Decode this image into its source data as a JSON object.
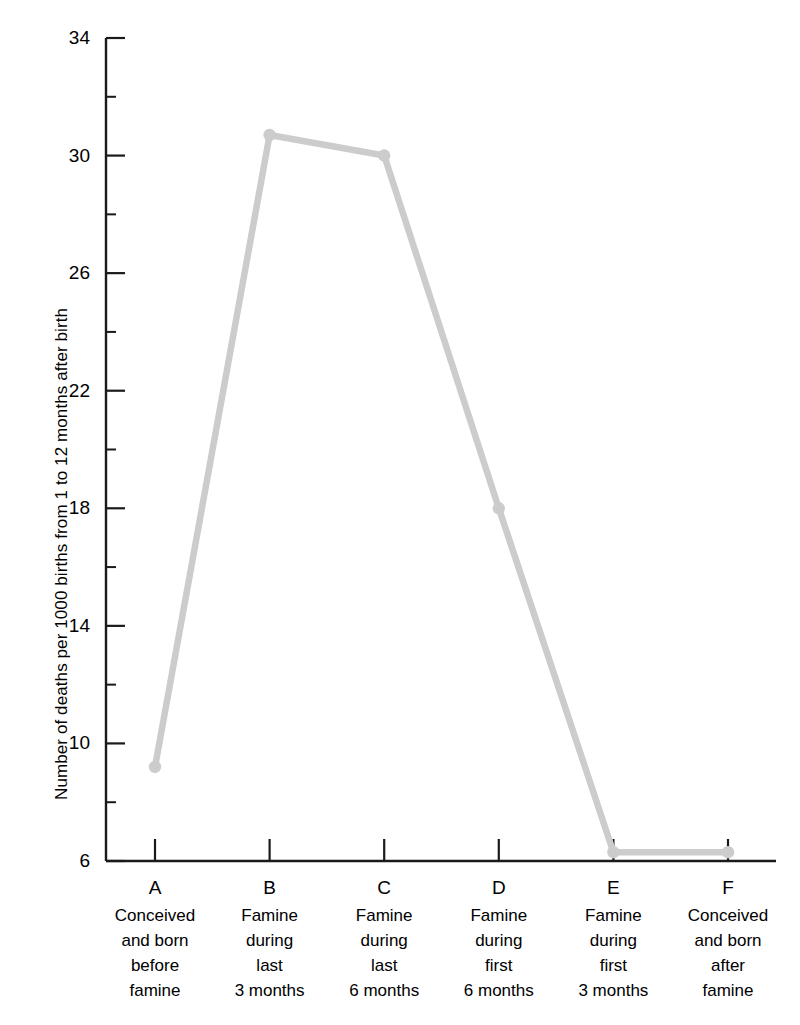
{
  "chart_data": {
    "type": "line",
    "title": "",
    "xlabel": "",
    "ylabel": "Number of deaths per 1000 births from 1 to 12 months after birth",
    "ylim": [
      6,
      34
    ],
    "ytick_labels": [
      "34",
      "30",
      "26",
      "22",
      "18",
      "14",
      "10",
      "6"
    ],
    "ytick_values": [
      34,
      30,
      26,
      22,
      18,
      14,
      10,
      6
    ],
    "yminor_values": [
      32,
      28,
      24,
      20,
      16,
      12,
      8
    ],
    "grid": false,
    "legend": "none",
    "line_color": "#cccccc",
    "axis_color": "#1a1a1a",
    "categories": [
      "A",
      "B",
      "C",
      "D",
      "E",
      "F"
    ],
    "category_labels": [
      [
        "Conceived",
        "and born",
        "before",
        "famine"
      ],
      [
        "Famine",
        "during",
        "last",
        "3 months"
      ],
      [
        "Famine",
        "during",
        "last",
        "6 months"
      ],
      [
        "Famine",
        "during",
        "first",
        "6 months"
      ],
      [
        "Famine",
        "during",
        "first",
        "3 months"
      ],
      [
        "Conceived",
        "and born",
        "after",
        "famine"
      ]
    ],
    "values": [
      9.2,
      30.7,
      30.0,
      18.0,
      6.3,
      6.3
    ]
  }
}
